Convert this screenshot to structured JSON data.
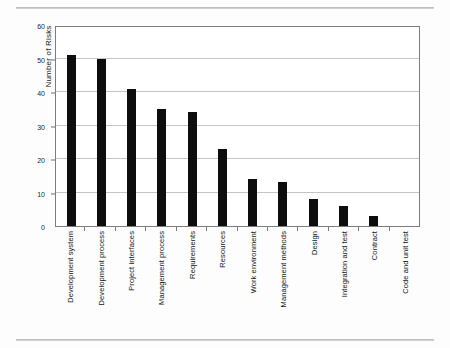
{
  "chart_data": {
    "type": "bar",
    "title": "",
    "xlabel": "",
    "ylabel": "Number of Risks",
    "ylim": [
      0,
      60
    ],
    "yticks": [
      0,
      10,
      20,
      30,
      40,
      50,
      60
    ],
    "grid": true,
    "legend": false,
    "orientation": "vertical",
    "bar_color": "#0d0d0d",
    "categories": [
      "Development system",
      "Development process",
      "Project interfaces",
      "Management process",
      "Requirements",
      "Resources",
      "Work environment",
      "Management methods",
      "Design",
      "Integration and test",
      "Contract",
      "Code and unit test"
    ],
    "values": [
      51,
      50,
      41,
      35,
      34,
      23,
      14,
      13,
      8,
      6,
      3,
      0
    ]
  },
  "figure": {
    "axis_color": "#7d7d7d",
    "gridline_color": "#c4c4c4",
    "background": "#ffffff"
  },
  "page": {
    "rule_top": "",
    "rule_bottom": ""
  }
}
